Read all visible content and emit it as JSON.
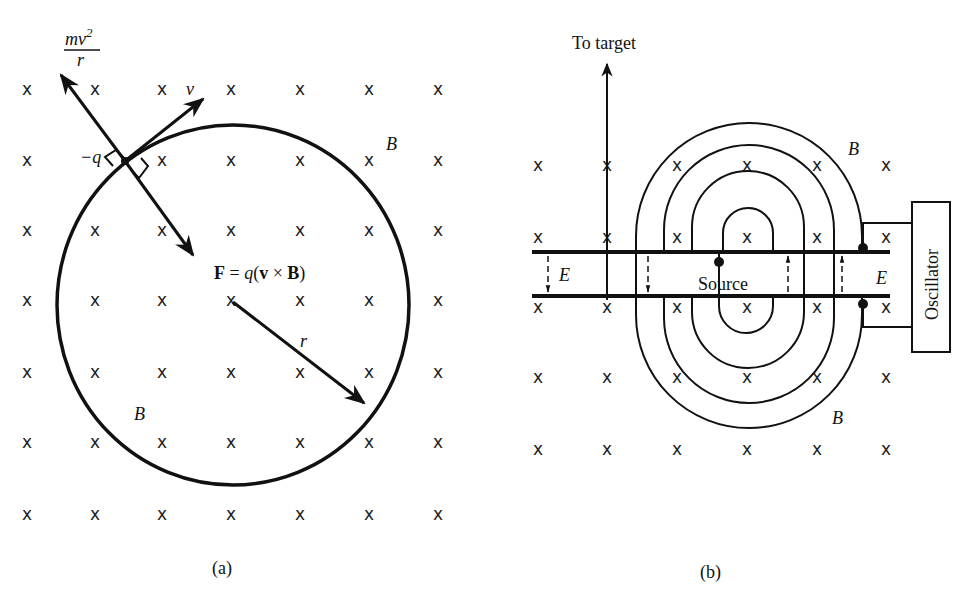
{
  "panel_a": {
    "caption": "(a)",
    "force_label_num": "mv",
    "force_label_exp": "2",
    "force_label_den": "r",
    "velocity_label": "v",
    "charge_label": "−q",
    "lorentz_F": "F",
    "lorentz_eq": " = ",
    "lorentz_q": "q",
    "lorentz_open": "(",
    "lorentz_v": "v",
    "lorentz_times": " × ",
    "lorentz_B": "B",
    "lorentz_close": ")",
    "radius_label": "r",
    "field_label_top": "B",
    "field_label_bottom": "B",
    "field_marker": "x"
  },
  "panel_b": {
    "caption": "(b)",
    "target_label": "To target",
    "source_label": "Source",
    "oscillator_label": "Oscillator",
    "field_label_top": "B",
    "field_label_bottom": "B",
    "efield_label_left": "E",
    "efield_label_right": "E",
    "field_marker": "x"
  }
}
